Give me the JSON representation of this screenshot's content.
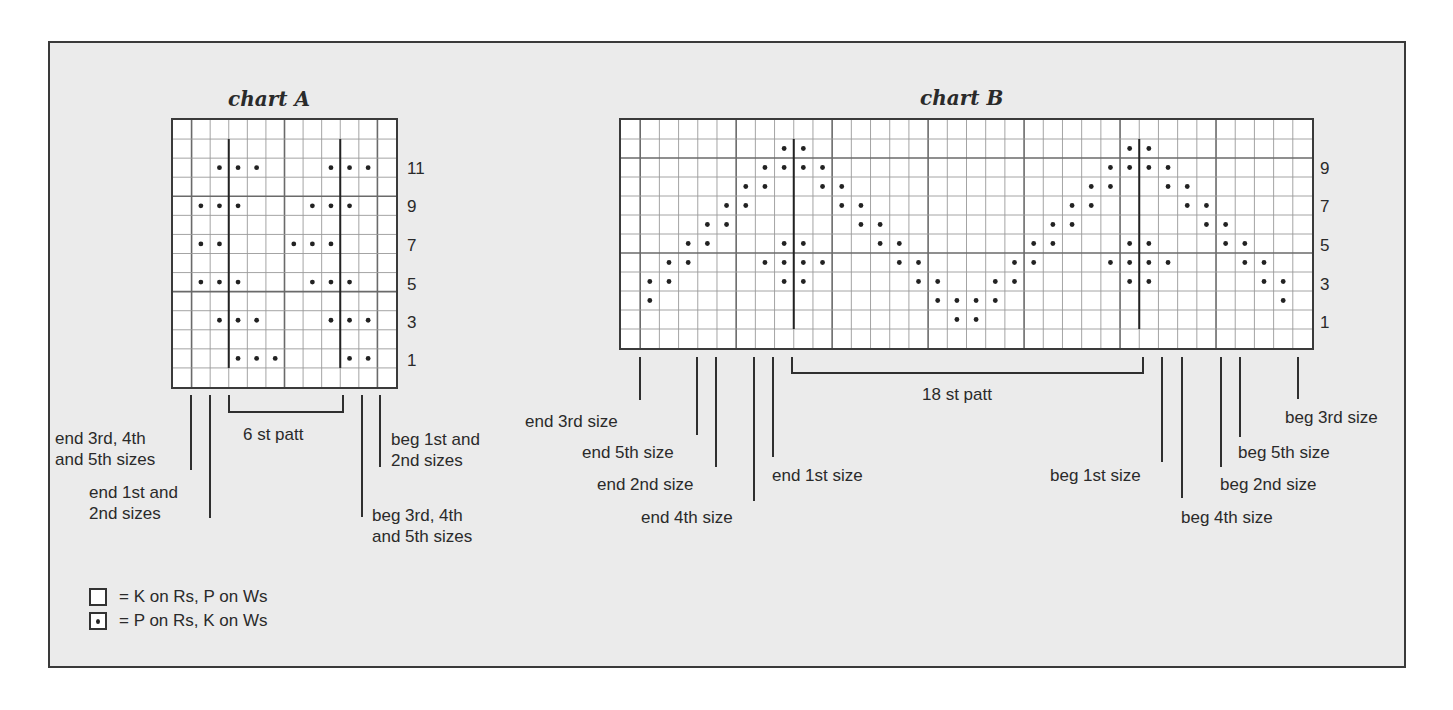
{
  "chart_data": [
    {
      "type": "table",
      "title": "chart A",
      "grid": {
        "cols": 12,
        "rows": 14
      },
      "row_labels": [
        {
          "label": "11",
          "row_index": 2
        },
        {
          "label": "9",
          "row_index": 4
        },
        {
          "label": "7",
          "row_index": 6
        },
        {
          "label": "5",
          "row_index": 8
        },
        {
          "label": "3",
          "row_index": 10
        },
        {
          "label": "1",
          "row_index": 12
        }
      ],
      "purl_cells": [
        [
          2,
          2
        ],
        [
          2,
          3
        ],
        [
          2,
          4
        ],
        [
          2,
          8
        ],
        [
          2,
          9
        ],
        [
          2,
          10
        ],
        [
          4,
          1
        ],
        [
          4,
          2
        ],
        [
          4,
          3
        ],
        [
          4,
          7
        ],
        [
          4,
          8
        ],
        [
          4,
          9
        ],
        [
          6,
          1
        ],
        [
          6,
          2
        ],
        [
          6,
          6
        ],
        [
          6,
          7
        ],
        [
          6,
          8
        ],
        [
          8,
          1
        ],
        [
          8,
          2
        ],
        [
          8,
          3
        ],
        [
          8,
          7
        ],
        [
          8,
          8
        ],
        [
          8,
          9
        ],
        [
          10,
          2
        ],
        [
          10,
          3
        ],
        [
          10,
          4
        ],
        [
          10,
          8
        ],
        [
          10,
          9
        ],
        [
          10,
          10
        ],
        [
          12,
          3
        ],
        [
          12,
          4
        ],
        [
          12,
          5
        ],
        [
          12,
          9
        ],
        [
          12,
          10
        ]
      ],
      "repeat_lines": [
        3,
        9
      ],
      "repeat_label": "6 st patt",
      "size_markers": [
        {
          "label": "end 3rd, 4th\nand 5th sizes",
          "col": 1
        },
        {
          "label": "end 1st and\n2nd sizes",
          "col": 2
        },
        {
          "label": "beg 3rd, 4th\nand 5th sizes",
          "col": 10
        },
        {
          "label": "beg 1st and\n2nd sizes",
          "col": 11
        }
      ]
    },
    {
      "type": "table",
      "title": "chart B",
      "grid": {
        "cols": 36,
        "rows": 12
      },
      "row_labels": [
        {
          "label": "9",
          "row_index": 2
        },
        {
          "label": "7",
          "row_index": 4
        },
        {
          "label": "5",
          "row_index": 6
        },
        {
          "label": "3",
          "row_index": 8
        },
        {
          "label": "1",
          "row_index": 10
        }
      ],
      "purl_cells": [
        [
          8,
          1
        ],
        [
          9,
          1
        ],
        [
          7,
          2
        ],
        [
          8,
          2
        ],
        [
          6,
          3
        ],
        [
          7,
          3
        ],
        [
          5,
          4
        ],
        [
          6,
          4
        ],
        [
          4,
          5
        ],
        [
          5,
          5
        ],
        [
          3,
          6
        ],
        [
          4,
          6
        ],
        [
          2,
          7
        ],
        [
          3,
          7
        ],
        [
          7,
          7
        ],
        [
          1,
          8
        ],
        [
          2,
          8
        ],
        [
          6,
          8
        ],
        [
          7,
          8
        ],
        [
          8,
          8
        ],
        [
          1,
          9
        ],
        [
          2,
          9
        ],
        [
          6,
          9
        ],
        [
          7,
          9
        ],
        [
          8,
          9
        ],
        [
          2,
          10
        ],
        [
          3,
          10
        ],
        [
          7,
          10
        ],
        [
          3,
          11
        ],
        [
          4,
          11
        ],
        [
          4,
          12
        ],
        [
          5,
          12
        ],
        [
          5,
          13
        ],
        [
          6,
          13
        ],
        [
          6,
          14
        ],
        [
          7,
          14
        ],
        [
          7,
          15
        ],
        [
          8,
          15
        ],
        [
          8,
          16
        ],
        [
          9,
          16
        ],
        [
          9,
          17
        ],
        [
          10,
          17
        ],
        [
          9,
          18
        ],
        [
          10,
          18
        ],
        [
          8,
          19
        ],
        [
          9,
          19
        ],
        [
          7,
          20
        ],
        [
          8,
          20
        ],
        [
          6,
          21
        ],
        [
          7,
          21
        ],
        [
          5,
          22
        ],
        [
          6,
          22
        ],
        [
          4,
          23
        ],
        [
          5,
          23
        ],
        [
          3,
          24
        ],
        [
          4,
          24
        ],
        [
          2,
          25
        ],
        [
          3,
          25
        ],
        [
          7,
          25
        ],
        [
          1,
          26
        ],
        [
          2,
          26
        ],
        [
          6,
          26
        ],
        [
          7,
          26
        ],
        [
          8,
          26
        ],
        [
          1,
          27
        ],
        [
          2,
          27
        ],
        [
          6,
          27
        ],
        [
          7,
          27
        ],
        [
          8,
          27
        ],
        [
          2,
          28
        ],
        [
          3,
          28
        ],
        [
          7,
          28
        ],
        [
          3,
          29
        ],
        [
          4,
          29
        ],
        [
          4,
          30
        ],
        [
          5,
          30
        ],
        [
          5,
          31
        ],
        [
          6,
          31
        ],
        [
          6,
          32
        ],
        [
          7,
          32
        ],
        [
          7,
          33
        ],
        [
          8,
          33
        ],
        [
          8,
          34
        ],
        [
          9,
          34
        ]
      ],
      "repeat_lines": [
        9,
        27
      ],
      "repeat_label": "18 st patt",
      "size_markers": [
        {
          "label": "end 3rd size",
          "col": 1
        },
        {
          "label": "end 5th size",
          "col": 4
        },
        {
          "label": "end 2nd size",
          "col": 5
        },
        {
          "label": "end 4th size",
          "col": 7
        },
        {
          "label": "end 1st size",
          "col": 8
        },
        {
          "label": "beg 1st size",
          "col": 28
        },
        {
          "label": "beg 4th size",
          "col": 29
        },
        {
          "label": "beg 2nd size",
          "col": 31
        },
        {
          "label": "beg 5th size",
          "col": 32
        },
        {
          "label": "beg 3rd size",
          "col": 35
        }
      ]
    }
  ],
  "chartA": {
    "title": "chart A",
    "row_labels": [
      "11",
      "9",
      "7",
      "5",
      "3",
      "1"
    ],
    "repeat_label": "6 st patt",
    "labels": {
      "end345_l1": "end 3rd, 4th",
      "end345_l2": "and 5th sizes",
      "end12_l1": "end 1st and",
      "end12_l2": "2nd sizes",
      "beg12_l1": "beg 1st and",
      "beg12_l2": "2nd sizes",
      "beg345_l1": "beg 3rd, 4th",
      "beg345_l2": "and 5th sizes"
    }
  },
  "chartB": {
    "title": "chart B",
    "row_labels": [
      "9",
      "7",
      "5",
      "3",
      "1"
    ],
    "repeat_label": "18 st patt",
    "labels": {
      "end3": "end 3rd size",
      "end5": "end 5th size",
      "end2": "end 2nd size",
      "end4": "end 4th size",
      "end1": "end 1st size",
      "beg1": "beg 1st size",
      "beg4": "beg 4th size",
      "beg2": "beg 2nd size",
      "beg5": "beg 5th size",
      "beg3": "beg 3rd size"
    }
  },
  "legend": {
    "knit": "= K on Rs, P on Ws",
    "purl": "= P on Rs, K on Ws"
  },
  "colors": {
    "background": "#ebebeb",
    "grid_line": "#9a9a9a",
    "grid_major": "#6a6a6a",
    "ink": "#2a2a2a"
  }
}
